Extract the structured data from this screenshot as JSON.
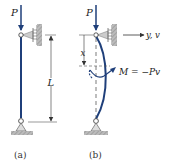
{
  "figures": [
    {
      "id": "a",
      "caption": "(a)",
      "load_label": "P",
      "dimension_label": "L",
      "description": "Straight pinned-pinned column under axial load P"
    },
    {
      "id": "b",
      "caption": "(b)",
      "load_label": "P",
      "axis_label": "y, v",
      "dimension_label": "x",
      "moment_label": "M = −Pv",
      "description": "Buckled column with deflected shape and internal moment"
    }
  ],
  "colors": {
    "column": "#1f3f7a",
    "dimension": "#333333",
    "support": "#888888",
    "hatch": "#999999"
  }
}
